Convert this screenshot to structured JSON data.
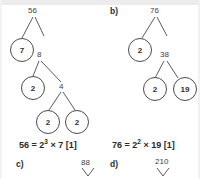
{
  "document": {
    "kind": "math-worksheet-answers",
    "topic": "prime factorisation factor trees"
  },
  "panels": [
    {
      "id": "a",
      "letter": "",
      "root": "56",
      "tree_labels": [
        "56",
        "8",
        "4"
      ],
      "circled_nodes": [
        "7",
        "2",
        "2",
        "2"
      ],
      "equation": {
        "lhs": "56",
        "eq": "=",
        "base": "2",
        "exponent": "3",
        "times": "×",
        "factor": "7",
        "mark": "[1]",
        "full": "56 = 2³ × 7 [1]"
      }
    },
    {
      "id": "b",
      "letter": "b)",
      "root": "76",
      "tree_labels": [
        "76",
        "38"
      ],
      "circled_nodes": [
        "2",
        "2",
        "19"
      ],
      "equation": {
        "lhs": "76",
        "eq": "=",
        "base": "2",
        "exponent": "2",
        "times": "×",
        "factor": "19",
        "mark": "[1]",
        "full": "76 = 2² × 19 [1]"
      }
    },
    {
      "id": "c",
      "letter": "c)",
      "root": "88",
      "tree_labels": [
        "88"
      ],
      "circled_nodes": [],
      "equation": null
    },
    {
      "id": "d",
      "letter": "d)",
      "root": "210",
      "tree_labels": [
        "210"
      ],
      "circled_nodes": [],
      "equation": null
    }
  ],
  "colors": {
    "ink": "#3f3f3f",
    "stroke": "#4a4a4a",
    "bold_ink": "#2b2b2b",
    "page_background": "#ffffff",
    "top_band": "#ececec"
  }
}
